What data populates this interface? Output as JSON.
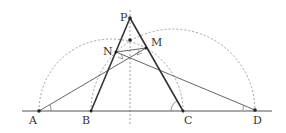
{
  "diagram": {
    "type": "geometry",
    "points": {
      "P": {
        "label": "P",
        "x": 130,
        "y": 18
      },
      "M": {
        "label": "M",
        "x": 146,
        "y": 48
      },
      "N": {
        "label": "N",
        "x": 116,
        "y": 52
      },
      "A": {
        "label": "A",
        "x": 39,
        "y": 111
      },
      "B": {
        "label": "B",
        "x": 91,
        "y": 111
      },
      "C": {
        "label": "C",
        "x": 183,
        "y": 111
      },
      "D": {
        "label": "D",
        "x": 255,
        "y": 110
      },
      "O": {
        "label": "",
        "x": 130,
        "y": 40
      }
    },
    "labels": {
      "P": "P",
      "M": "M",
      "N": "N",
      "A": "A",
      "B": "B",
      "C": "C",
      "D": "D"
    },
    "segments": [
      {
        "from": "P",
        "to": "B",
        "style": "bold"
      },
      {
        "from": "P",
        "to": "C",
        "style": "bold"
      },
      {
        "from": "A",
        "to": "M",
        "style": "thin"
      },
      {
        "from": "D",
        "to": "N",
        "style": "thin"
      },
      {
        "from": "N",
        "to": "M",
        "style": "thin"
      }
    ],
    "baseline": {
      "x1": 22,
      "x2": 272,
      "y": 111
    },
    "axis_of_symmetry": {
      "x": 130,
      "y1": 10,
      "y2": 126,
      "style": "dashed"
    },
    "arcs": [
      {
        "name": "semicircle-AC",
        "cx": 111,
        "cy": 111,
        "r": 72,
        "style": "dashed"
      },
      {
        "name": "semicircle-BD",
        "cx": 173,
        "cy": 111,
        "r": 82,
        "style": "dashed"
      }
    ],
    "colors": {
      "stroke": "#333333",
      "dashed": "#888888",
      "background": "#ffffff"
    }
  }
}
